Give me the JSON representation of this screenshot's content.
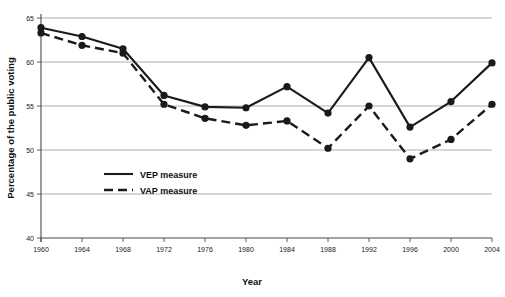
{
  "chart_data": {
    "type": "line",
    "title": "",
    "xlabel": "Year",
    "ylabel": "Percentage of the public voting",
    "categories": [
      1960,
      1964,
      1968,
      1972,
      1976,
      1980,
      1984,
      1988,
      1992,
      1996,
      2000,
      2004
    ],
    "xtick_labels": [
      "1960",
      "1964",
      "1968",
      "1972",
      "1976",
      "1980",
      "1984",
      "1988",
      "1992",
      "1996",
      "2000",
      "2004"
    ],
    "ytick_labels": [
      "40",
      "45",
      "50",
      "55",
      "60",
      "65"
    ],
    "ytick_values": [
      40,
      45,
      50,
      55,
      60,
      65
    ],
    "ylim": [
      40,
      65
    ],
    "xlim": [
      1960,
      2004
    ],
    "grid": "horizontal",
    "legend_position": "inside-lower-left",
    "series": [
      {
        "name": "VEP measure",
        "style": "solid",
        "color": "#1a1a1a",
        "values": [
          63.9,
          62.9,
          61.5,
          56.2,
          54.9,
          54.8,
          57.2,
          54.2,
          60.5,
          52.6,
          55.5,
          59.9
        ]
      },
      {
        "name": "VAP measure",
        "style": "dashed",
        "color": "#1a1a1a",
        "values": [
          63.3,
          61.9,
          61.0,
          55.2,
          53.6,
          52.8,
          53.3,
          50.2,
          55.0,
          49.0,
          51.2,
          55.2
        ]
      }
    ]
  },
  "legend": {
    "items": [
      {
        "label": "VEP measure",
        "style": "solid"
      },
      {
        "label": "VAP measure",
        "style": "dashed"
      }
    ]
  },
  "axes": {
    "x_axis_title": "Year",
    "y_axis_title": "Percentage of the public voting"
  }
}
